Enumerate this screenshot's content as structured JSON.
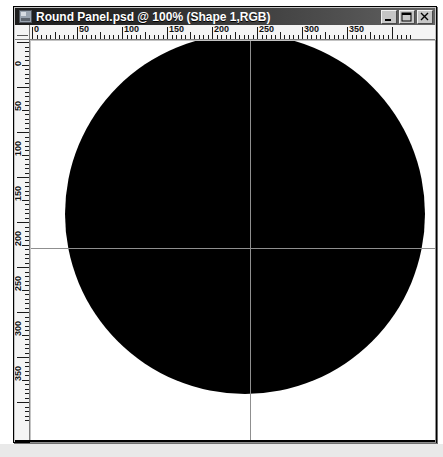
{
  "window": {
    "title": "Round Panel.psd @ 100% (Shape 1,RGB)",
    "icon": "photoshop-document-icon",
    "controls": [
      {
        "name": "minimize",
        "glyph": "_"
      },
      {
        "name": "maximize",
        "glyph": "□"
      },
      {
        "name": "close",
        "glyph": "×"
      }
    ]
  },
  "rulers": {
    "units": "pixels",
    "horizontal": {
      "labels": [
        "0",
        "50",
        "100",
        "150",
        "200",
        "250",
        "300",
        "350"
      ],
      "values": [
        0,
        50,
        100,
        150,
        200,
        250,
        300,
        350
      ],
      "major_interval": 50,
      "minor_interval": 5
    },
    "vertical": {
      "labels": [
        "0",
        "50",
        "100",
        "150",
        "200",
        "250",
        "300",
        "350"
      ],
      "values": [
        0,
        50,
        100,
        150,
        200,
        250,
        300,
        350
      ],
      "major_interval": 50,
      "minor_interval": 5
    }
  },
  "canvas": {
    "background_color": "#ffffff",
    "zoom_label": "100%",
    "shape": {
      "name": "Shape 1",
      "type": "circle",
      "fill_color": "#000000",
      "center_x": 200,
      "center_y": 175,
      "diameter": 360
    },
    "guides": [
      {
        "orientation": "vertical",
        "position": 200,
        "color": "#8f8f8f"
      },
      {
        "orientation": "horizontal",
        "position": 200,
        "color": "#8f8f8f"
      }
    ]
  },
  "colors": {
    "titlebar_start": "#1d1d1d",
    "titlebar_end": "#636363",
    "titlebar_text": "#ffffff",
    "window_face": "#c3c3c3",
    "ruler_face": "#f4f4f4",
    "desktop": "#e9e9e9"
  }
}
